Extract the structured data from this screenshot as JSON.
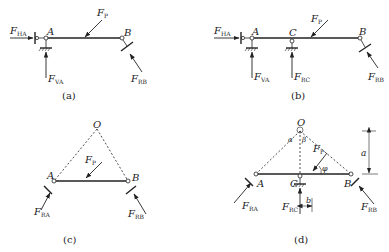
{
  "figure": {
    "panels": [
      {
        "id": "a",
        "caption": "(a)",
        "labels": {
          "A": "A",
          "B": "B"
        },
        "forces": {
          "FHA": {
            "main": "F",
            "sub": "HA"
          },
          "FVA": {
            "main": "F",
            "sub": "VA"
          },
          "Fp": {
            "main": "F",
            "sub": "P"
          },
          "FRB": {
            "main": "F",
            "sub": "RB"
          }
        }
      },
      {
        "id": "b",
        "caption": "(b)",
        "labels": {
          "A": "A",
          "B": "B",
          "C": "C"
        },
        "forces": {
          "FHA": {
            "main": "F",
            "sub": "HA"
          },
          "FVA": {
            "main": "F",
            "sub": "VA"
          },
          "FRC": {
            "main": "F",
            "sub": "RC"
          },
          "Fp": {
            "main": "F",
            "sub": "P"
          },
          "FRB": {
            "main": "F",
            "sub": "RB"
          }
        }
      },
      {
        "id": "c",
        "caption": "(c)",
        "labels": {
          "A": "A",
          "B": "B",
          "O": "O"
        },
        "forces": {
          "Fp": {
            "main": "F",
            "sub": "P"
          },
          "FRA": {
            "main": "F",
            "sub": "RA"
          },
          "FRB": {
            "main": "F",
            "sub": "RB"
          }
        }
      },
      {
        "id": "d",
        "caption": "(d)",
        "labels": {
          "A": "A",
          "B": "B",
          "C": "C",
          "O": "O",
          "alpha": "α",
          "beta": "β",
          "phi": "φ",
          "a": "a",
          "b": "b"
        },
        "forces": {
          "Fp": {
            "main": "F",
            "sub": "P"
          },
          "FRA": {
            "main": "F",
            "sub": "RA"
          },
          "FRB": {
            "main": "F",
            "sub": "RB"
          },
          "FRC": {
            "main": "F",
            "sub": "RC"
          }
        }
      }
    ]
  }
}
